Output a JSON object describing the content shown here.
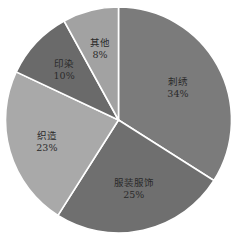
{
  "chart_data": {
    "type": "pie",
    "title": "",
    "categories": [
      "刺绣",
      "服装服饰",
      "织造",
      "印染",
      "其他"
    ],
    "values": [
      34,
      25,
      23,
      10,
      8
    ],
    "unit": "%",
    "start_angle": "12 o'clock",
    "direction": "clockwise",
    "legend": "none (labels inside slices)",
    "slices": [
      {
        "label": "刺绣",
        "percent": "34%",
        "value": 34,
        "color": "#7b7b7b"
      },
      {
        "label": "服装服饰",
        "percent": "25%",
        "value": 25,
        "color": "#6f6f6f"
      },
      {
        "label": "织造",
        "percent": "23%",
        "value": 23,
        "color": "#a9a9a9"
      },
      {
        "label": "印染",
        "percent": "10%",
        "value": 10,
        "color": "#6a6a6a"
      },
      {
        "label": "其他",
        "percent": "8%",
        "value": 8,
        "color": "#a2a2a2"
      }
    ],
    "separator_color": "#ffffff"
  }
}
